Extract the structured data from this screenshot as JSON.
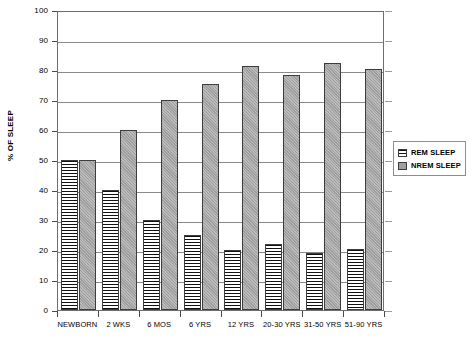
{
  "chart_data": {
    "type": "bar",
    "title": "",
    "xlabel": "",
    "ylabel": "% OF SLEEP",
    "ylim": [
      0,
      100
    ],
    "ytick_step": 10,
    "yticks": [
      100,
      90,
      80,
      70,
      60,
      50,
      40,
      30,
      20,
      10,
      0
    ],
    "grid": true,
    "legend_position": "right",
    "categories": [
      "NEWBORN",
      "2 WKS",
      "6 MOS",
      "6 YRS",
      "12 YRS",
      "20-30 YRS",
      "31-50 YRS",
      "51-90 YRS"
    ],
    "series": [
      {
        "name": "REM SLEEP",
        "color": "#ffffff",
        "pattern": "horizontal-stripes",
        "values": [
          50,
          40,
          30,
          25,
          20,
          22,
          19,
          20.5
        ]
      },
      {
        "name": "NREM SLEEP",
        "color": "#9e9e9e",
        "pattern": "solid-gray",
        "values": [
          50,
          60,
          70,
          75.5,
          81.5,
          78.5,
          82.5,
          80.5
        ]
      }
    ]
  },
  "legend": {
    "items": [
      {
        "label": "REM SLEEP"
      },
      {
        "label": "NREM SLEEP"
      }
    ]
  }
}
